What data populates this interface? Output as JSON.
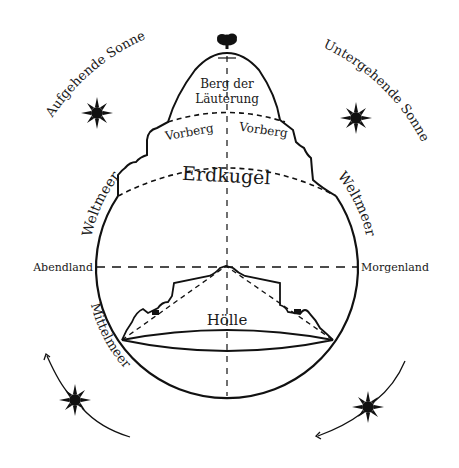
{
  "diagram": {
    "labels": {
      "purgatory": [
        "Berg der",
        "Läuterung"
      ],
      "foothill_left": "Vorberg",
      "foothill_right": "Vorberg",
      "earth": "Erdkugel",
      "hell": "Hölle",
      "west": "Abendland",
      "east": "Morgenland",
      "ocean_left": "Weltmeer",
      "ocean_right": "Weltmeer",
      "mediterranean": "Mittelmeer",
      "rising_sun": "Aufgehende Sonne",
      "setting_sun": "Untergehende Sonne"
    },
    "icons": {
      "sun": "sun-icon",
      "cloud": "cloud-icon"
    },
    "colors": {
      "ink": "#111111",
      "background": "#ffffff"
    }
  }
}
